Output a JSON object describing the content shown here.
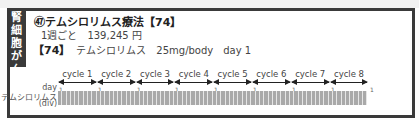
{
  "sidebar": {
    "category_chars": [
      "腎",
      "細",
      "胞",
      "が",
      "ん"
    ]
  },
  "regimen": {
    "title": "㊼テムシロリムス療法【74】",
    "cost_interval": "1週ごと",
    "cost_value": "139,245 円"
  },
  "drug": {
    "tag": "【74】",
    "name": "テムシロリムス",
    "dose": "25mg/body",
    "day": "day 1"
  },
  "schedule": {
    "day_label": "day",
    "drug_label": "テムシロリムス",
    "route_label": "(div)",
    "cycles": [
      "cycle 1",
      "cycle 2",
      "cycle 3",
      "cycle 4",
      "cycle 5",
      "cycle 6",
      "cycle 7",
      "cycle 8"
    ],
    "day_ticks": [
      "1",
      "1",
      "1",
      "1",
      "1",
      "1",
      "1",
      "1",
      "1"
    ],
    "bars_per_cycle": 9
  }
}
